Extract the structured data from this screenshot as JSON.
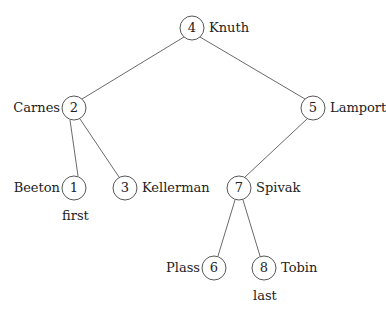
{
  "diagram": {
    "type": "binary-search-tree",
    "nodes": [
      {
        "key": "4",
        "name": "Knuth",
        "x": 192,
        "y": 28,
        "side": "right"
      },
      {
        "key": "2",
        "name": "Carnes",
        "x": 74,
        "y": 108,
        "side": "left"
      },
      {
        "key": "5",
        "name": "Lamport",
        "x": 313,
        "y": 108,
        "side": "right"
      },
      {
        "key": "1",
        "name": "Beeton",
        "x": 74,
        "y": 188,
        "side": "left",
        "note": "first"
      },
      {
        "key": "3",
        "name": "Kellerman",
        "x": 125,
        "y": 188,
        "side": "right"
      },
      {
        "key": "7",
        "name": "Spivak",
        "x": 239,
        "y": 188,
        "side": "right"
      },
      {
        "key": "6",
        "name": "Plass",
        "x": 214,
        "y": 268,
        "side": "left"
      },
      {
        "key": "8",
        "name": "Tobin",
        "x": 264,
        "y": 268,
        "side": "right",
        "note": "last"
      }
    ],
    "edges": [
      [
        "4",
        "2"
      ],
      [
        "4",
        "5"
      ],
      [
        "2",
        "1"
      ],
      [
        "2",
        "3"
      ],
      [
        "5",
        "7"
      ],
      [
        "7",
        "6"
      ],
      [
        "7",
        "8"
      ]
    ]
  }
}
